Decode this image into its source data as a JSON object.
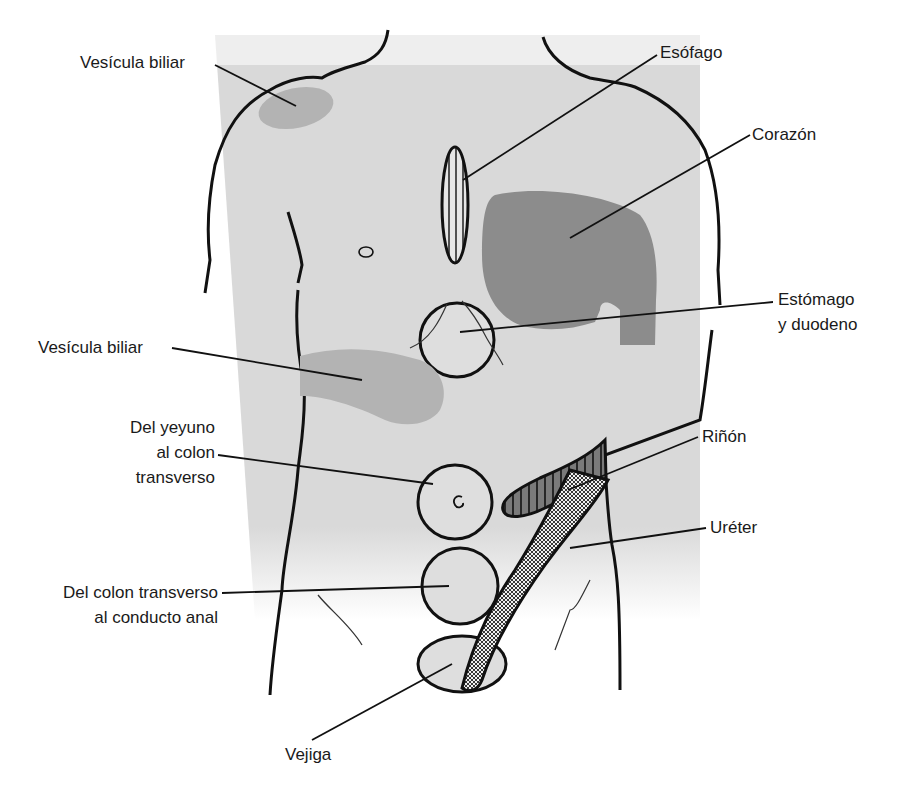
{
  "diagram": {
    "colors": {
      "skin": "#d9d9d9",
      "light_organ": "#b3b3b3",
      "heart": "#8c8c8c",
      "outline": "#111111",
      "background": "#ffffff"
    },
    "labels": {
      "vesicula_top": "Vesícula biliar",
      "esofago": "Esófago",
      "corazon": "Corazón",
      "estomago_1": "Estómago",
      "estomago_2": "y duodeno",
      "vesicula_mid": "Vesícula biliar",
      "yeyuno_1": "Del yeyuno",
      "yeyuno_2": "al colon",
      "yeyuno_3": "transverso",
      "rinon": "Riñón",
      "ureter": "Uréter",
      "colon_1": "Del colon transverso",
      "colon_2": "al conducto anal",
      "vejiga": "Vejiga"
    },
    "regions": [
      {
        "name": "Vesícula biliar (shoulder)",
        "shape": "ellipse",
        "fill": "light"
      },
      {
        "name": "Esófago",
        "shape": "vertical ellipse",
        "fill": "vertical stripes"
      },
      {
        "name": "Corazón",
        "shape": "blob",
        "fill": "dark"
      },
      {
        "name": "Estómago y duodeno",
        "shape": "circle",
        "fill": "none"
      },
      {
        "name": "Vesícula biliar (abdomen)",
        "shape": "blob",
        "fill": "light"
      },
      {
        "name": "Del yeyuno al colon transverso",
        "shape": "circle",
        "fill": "none"
      },
      {
        "name": "Riñón",
        "shape": "elongated",
        "fill": "vertical stripes"
      },
      {
        "name": "Uréter",
        "shape": "diagonal band",
        "fill": "crosshatch"
      },
      {
        "name": "Del colon transverso al conducto anal",
        "shape": "circle",
        "fill": "none"
      },
      {
        "name": "Vejiga",
        "shape": "ellipse",
        "fill": "none"
      }
    ]
  }
}
